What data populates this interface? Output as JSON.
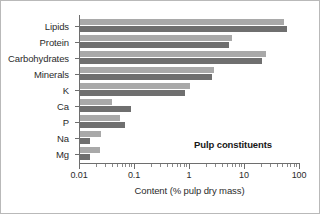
{
  "chart_data": {
    "type": "bar",
    "orientation": "horizontal",
    "title": "",
    "annotation": "Pulp constituents",
    "xlabel": "Content (% pulp dry mass)",
    "ylabel": "",
    "xscale": "log",
    "xlim": [
      0.01,
      100
    ],
    "xticks": [
      0.01,
      0.1,
      1,
      10,
      100
    ],
    "xticklabels": [
      "0.01",
      "0.1",
      "1",
      "10",
      "100"
    ],
    "grid": false,
    "legend": "none",
    "categories": [
      "Lipids",
      "Protein",
      "Carbohydrates",
      "Minerals",
      "K",
      "Ca",
      "P",
      "Na",
      "Mg"
    ],
    "series": [
      {
        "name": "light",
        "color": "#a9a9a9",
        "values": [
          53,
          6.1,
          25,
          2.9,
          1.05,
          0.04,
          0.055,
          0.025,
          0.024
        ]
      },
      {
        "name": "dark",
        "color": "#6f6f6f",
        "values": [
          60,
          5.4,
          21,
          2.6,
          0.85,
          0.09,
          0.07,
          0.016,
          0.016
        ]
      }
    ]
  },
  "figure": {
    "background": "#ffffff",
    "axis_color": "#6e6e6e",
    "text_color": "#2b2b2b"
  }
}
